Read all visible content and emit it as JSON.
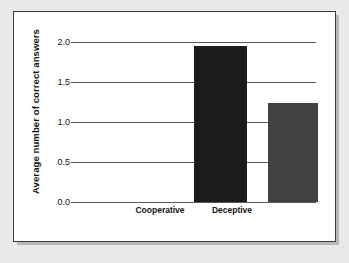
{
  "chart_data": {
    "type": "bar",
    "title": "",
    "xlabel": "",
    "ylabel": "Average number of correct answers",
    "categories": [
      "Cooperative",
      "Deceptive"
    ],
    "values": [
      1.95,
      1.24
    ],
    "ylim": [
      0.0,
      2.0
    ],
    "yticks": [
      "0.0",
      "0.5",
      "1.0",
      "1.5",
      "2.0"
    ],
    "ytick_values": [
      0.0,
      0.5,
      1.0,
      1.5,
      2.0
    ],
    "grid": true,
    "legend": "none",
    "bar_colors": [
      "#1b1b1b",
      "#414141"
    ],
    "background_color": "#ffffff",
    "frame_color": "#3c3c3c",
    "gridline_color": "#58585a"
  },
  "figure": {
    "page_background": "#e9e9e9"
  }
}
